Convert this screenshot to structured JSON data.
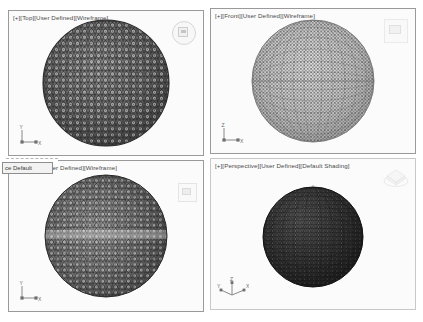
{
  "app": {
    "title": "CAD Viewport Grid",
    "background": "#ffffff",
    "panel_background": "#fbfbfb",
    "border_color": "#9a9a9a",
    "label_color": "#4a4a4a"
  },
  "viewports": [
    {
      "key": "top-left",
      "label": "[+][Top][User Defined][Wireframe]",
      "view": "Top",
      "shading": "Wireframe",
      "projection": "User Defined",
      "gizmo": "view-navigator-round-icon",
      "axes": [
        "Y",
        "X"
      ],
      "mesh": {
        "style": "geodesic-wireframe",
        "tone": "dark",
        "stroke": "#303030",
        "fill": "#6d6d6d"
      }
    },
    {
      "key": "top-right",
      "label": "[+][Front][User Defined][Wireframe]",
      "view": "Front",
      "shading": "Wireframe",
      "projection": "User Defined",
      "gizmo": "view-navigator-square-icon",
      "axes": [
        "Z",
        "X"
      ],
      "mesh": {
        "style": "latlong-wireframe",
        "tone": "light",
        "stroke": "#5a5a5a",
        "fill": "#c9c9c9"
      }
    },
    {
      "key": "bottom-left",
      "label": "[User Defined][Wireframe]",
      "view": "User Defined",
      "shading": "Wireframe",
      "projection": "User Defined",
      "gizmo": "view-navigator-small-icon",
      "axes": [
        "Y",
        "X"
      ],
      "mesh": {
        "style": "geodesic-wireframe",
        "tone": "mid",
        "stroke": "#2f2f2f",
        "fill": "#808080"
      }
    },
    {
      "key": "bottom-right",
      "label": "[+][Perspective][User Defined][Default Shading]",
      "view": "Perspective",
      "shading": "Default Shading",
      "projection": "User Defined",
      "gizmo": "view-cube-icon",
      "axes": [
        "Z",
        "X",
        "Y"
      ],
      "mesh": {
        "style": "shaded-triangulated",
        "tone": "very-dark",
        "stroke": "#1e1e1e",
        "fill": "#3a3a3a"
      }
    }
  ],
  "popup": {
    "text": "ce Default",
    "full_hint": "ce Default"
  }
}
